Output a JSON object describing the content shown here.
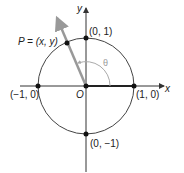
{
  "diagram": {
    "axes": {
      "x_label": "x",
      "y_label": "y",
      "origin_label": "O"
    },
    "points": [
      {
        "label": "(0, 1)"
      },
      {
        "label": "(1, 0)"
      },
      {
        "label": "(−1, 0)"
      },
      {
        "label": "(0, −1)"
      }
    ],
    "point_p": {
      "label": "P = (x, y)"
    },
    "angle": {
      "label": "θ"
    },
    "colors": {
      "circle": "#444444",
      "axes": "#333333",
      "ray": "#999999",
      "arc": "#aaaaaa"
    }
  }
}
